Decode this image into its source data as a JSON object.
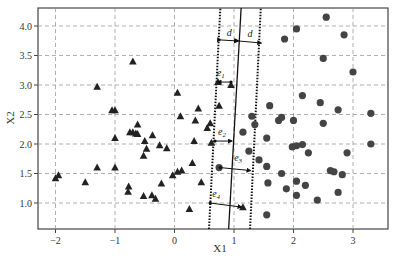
{
  "chart_data": {
    "type": "scatter",
    "title": "",
    "xlabel": "X1",
    "ylabel": "X2",
    "xlim": [
      -2.25,
      3.6
    ],
    "ylim": [
      0.57,
      4.3
    ],
    "xticks": [
      -2,
      -1,
      0,
      1,
      2,
      3
    ],
    "yticks": [
      1.0,
      1.5,
      2.0,
      2.5,
      3.0,
      3.5,
      4.0
    ],
    "xtick_labels": [
      "−2",
      "−1",
      "0",
      "1",
      "2",
      "3"
    ],
    "ytick_labels": [
      "1.0",
      "1.5",
      "2.0",
      "2.5",
      "3.0",
      "3.5",
      "4.0"
    ],
    "grid": true,
    "legend": null,
    "series": [
      {
        "name": "class -1",
        "marker": "triangle",
        "color": "#222222",
        "points": [
          [
            -2.0,
            1.42
          ],
          [
            -1.95,
            1.47
          ],
          [
            -1.5,
            1.35
          ],
          [
            -1.3,
            1.6
          ],
          [
            -1.3,
            2.97
          ],
          [
            -1.05,
            2.57
          ],
          [
            -1.0,
            2.57
          ],
          [
            -1.0,
            2.1
          ],
          [
            -1.0,
            1.6
          ],
          [
            -0.7,
            3.4
          ],
          [
            -0.75,
            2.2
          ],
          [
            -0.7,
            2.2
          ],
          [
            -0.65,
            2.18
          ],
          [
            -0.62,
            2.17
          ],
          [
            -0.62,
            2.33
          ],
          [
            -0.5,
            2.05
          ],
          [
            -0.47,
            1.92
          ],
          [
            -0.52,
            1.8
          ],
          [
            -0.37,
            2.15
          ],
          [
            -0.25,
            1.98
          ],
          [
            -0.13,
            1.93
          ],
          [
            -0.77,
            1.28
          ],
          [
            -0.78,
            1.19
          ],
          [
            -0.52,
            1.12
          ],
          [
            -0.38,
            1.13
          ],
          [
            -0.32,
            1.07
          ],
          [
            -0.22,
            1.33
          ],
          [
            -0.03,
            1.47
          ],
          [
            0.05,
            1.53
          ],
          [
            0.12,
            1.55
          ],
          [
            0.05,
            2.87
          ],
          [
            0.1,
            2.47
          ],
          [
            0.4,
            2.6
          ],
          [
            0.35,
            2.4
          ],
          [
            0.55,
            2.27
          ],
          [
            0.33,
            2.05
          ],
          [
            0.25,
            0.9
          ],
          [
            0.6,
            2.35
          ],
          [
            0.75,
            2.65
          ],
          [
            0.73,
            3.05
          ],
          [
            0.95,
            3.0
          ],
          [
            0.45,
            1.35
          ],
          [
            0.3,
            1.68
          ],
          [
            1.15,
            0.93
          ],
          [
            0.62,
            2.02
          ]
        ]
      },
      {
        "name": "class +1",
        "marker": "circle",
        "color": "#444444",
        "points": [
          [
            2.55,
            4.15
          ],
          [
            2.05,
            3.95
          ],
          [
            1.85,
            3.78
          ],
          [
            2.85,
            3.85
          ],
          [
            2.5,
            3.45
          ],
          [
            3.0,
            3.22
          ],
          [
            2.15,
            2.82
          ],
          [
            2.45,
            2.7
          ],
          [
            2.75,
            2.58
          ],
          [
            1.6,
            2.65
          ],
          [
            3.3,
            2.52
          ],
          [
            1.35,
            2.33
          ],
          [
            1.3,
            2.47
          ],
          [
            1.15,
            2.2
          ],
          [
            1.75,
            2.4
          ],
          [
            1.8,
            2.45
          ],
          [
            2.0,
            2.4
          ],
          [
            2.5,
            2.35
          ],
          [
            1.55,
            2.1
          ],
          [
            1.98,
            1.95
          ],
          [
            2.05,
            1.97
          ],
          [
            2.15,
            1.99
          ],
          [
            2.25,
            1.85
          ],
          [
            2.9,
            1.85
          ],
          [
            1.42,
            1.73
          ],
          [
            3.3,
            2.0
          ],
          [
            1.55,
            1.62
          ],
          [
            1.8,
            1.5
          ],
          [
            2.62,
            1.55
          ],
          [
            2.68,
            1.53
          ],
          [
            2.82,
            1.48
          ],
          [
            1.57,
            1.34
          ],
          [
            2.05,
            1.37
          ],
          [
            1.88,
            1.24
          ],
          [
            2.2,
            1.3
          ],
          [
            2.75,
            1.18
          ],
          [
            2.05,
            1.13
          ],
          [
            2.4,
            1.05
          ],
          [
            1.55,
            0.8
          ],
          [
            0.75,
            1.6
          ],
          [
            1.25,
            1.88
          ]
        ]
      }
    ],
    "lines": [
      {
        "name": "separating hyperplane",
        "style": "solid",
        "x_at_bottom": 0.91,
        "x_at_top": 1.12
      },
      {
        "name": "margin left",
        "style": "dotted",
        "x_at_bottom": 0.58,
        "x_at_top": 0.77
      },
      {
        "name": "margin right",
        "style": "dotted",
        "x_at_bottom": 1.27,
        "x_at_top": 1.45
      }
    ],
    "annotations": [
      {
        "text": "d",
        "x": 0.95,
        "y": 3.8,
        "note": "margin width left"
      },
      {
        "text": "d",
        "x": 1.38,
        "y": 3.8,
        "note": "margin width right"
      },
      {
        "text": "e1",
        "x": 0.83,
        "y": 3.15,
        "arrow_from": [
          0.95,
          3.05
        ],
        "arrow_to": [
          0.72,
          3.05
        ]
      },
      {
        "text": "e2",
        "x": 0.85,
        "y": 2.15,
        "arrow_from": [
          0.68,
          2.05
        ],
        "arrow_to": [
          0.97,
          2.05
        ]
      },
      {
        "text": "e3",
        "x": 1.12,
        "y": 1.72,
        "arrow_from": [
          0.77,
          1.6
        ],
        "arrow_to": [
          1.28,
          1.55
        ]
      },
      {
        "text": "e4",
        "x": 0.75,
        "y": 1.1,
        "arrow_from": [
          0.6,
          1.0
        ],
        "arrow_to": [
          1.13,
          0.93
        ]
      }
    ]
  },
  "labels": {
    "xlabel": "X1",
    "ylabel": "X2",
    "d_left": "d",
    "d_right": "d",
    "e1": "e",
    "e1_sub": "1",
    "e2": "e",
    "e2_sub": "2",
    "e3": "e",
    "e3_sub": "3",
    "e4": "e",
    "e4_sub": "4"
  }
}
